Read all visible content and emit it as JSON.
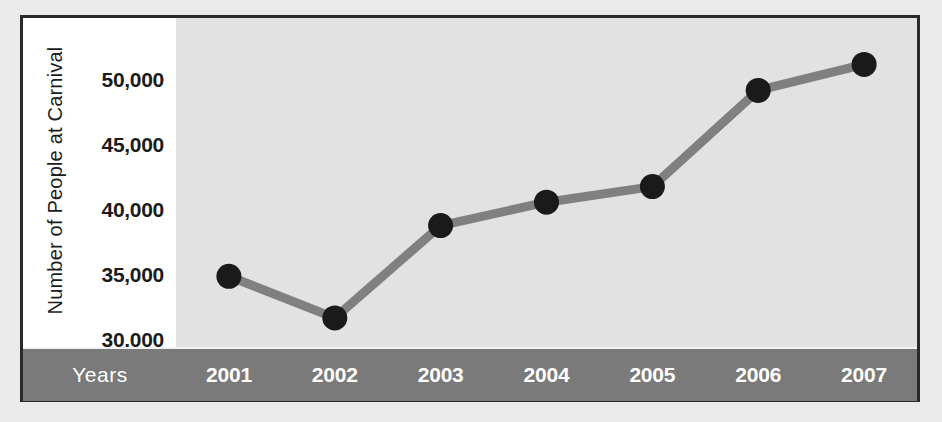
{
  "chart_data": {
    "type": "line",
    "title": "",
    "xlabel": "Years",
    "ylabel": "Number of People at Carnival",
    "categories": [
      "2001",
      "2002",
      "2003",
      "2004",
      "2005",
      "2006",
      "2007"
    ],
    "values": [
      34900,
      31700,
      38800,
      40600,
      41800,
      49200,
      51200
    ],
    "series": [
      {
        "name": "Number of People at Carnival",
        "values": [
          34900,
          31700,
          38800,
          40600,
          41800,
          49200,
          51200
        ]
      }
    ],
    "ylim": [
      27500,
      52500
    ],
    "yticks": [
      30000,
      35000,
      40000,
      45000,
      50000
    ],
    "ytick_labels": [
      "30,000",
      "35,000",
      "40,000",
      "45,000",
      "50,000"
    ],
    "grid": false,
    "legend": "none",
    "colors": {
      "line": "#808080",
      "marker": "#1a1a1a",
      "plot_background": "#e2e2e2",
      "axis_band": "#7a7a7a",
      "frame": "#2a2a2a",
      "label_panel": "#ffffff",
      "page_background": "#ebebeb",
      "band_text": "#ffffff",
      "tick_text": "#1c1c1c"
    }
  },
  "axis": {
    "y_title": "Number of People at Carnival",
    "x_title": "Years",
    "ticks": [
      {
        "label": "50,000",
        "value": 50000
      },
      {
        "label": "45,000",
        "value": 45000
      },
      {
        "label": "40,000",
        "value": 40000
      },
      {
        "label": "35,000",
        "value": 35000
      },
      {
        "label": "30,000",
        "value": 30000
      }
    ]
  }
}
